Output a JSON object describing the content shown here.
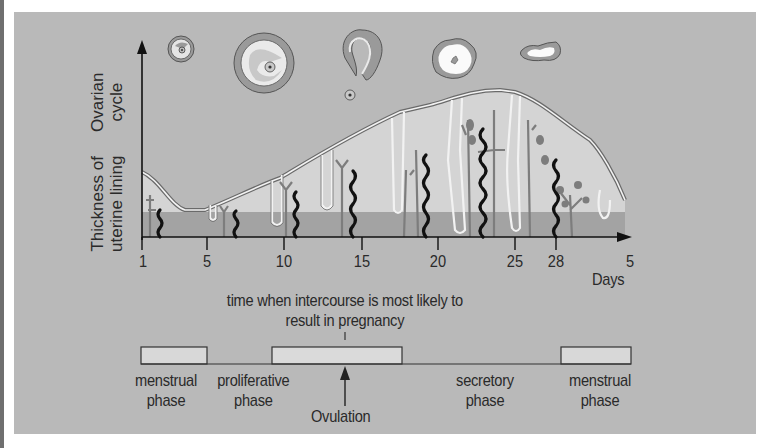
{
  "diagram": {
    "y_axis_labels": {
      "upper": [
        "Ovarian",
        "cycle"
      ],
      "lower": [
        "Thickness of",
        "uterine lining"
      ]
    },
    "x_axis": {
      "ticks": [
        "1",
        "5",
        "10",
        "15",
        "20",
        "25",
        "28",
        "5"
      ],
      "unit_label": "Days"
    },
    "fertile_window_note": [
      "time when intercourse is most likely to",
      "result in pregnancy"
    ],
    "phases": [
      {
        "label": [
          "menstrual",
          "phase"
        ]
      },
      {
        "label": [
          "proliferative",
          "phase"
        ]
      },
      {
        "label": [
          "secretory",
          "phase"
        ]
      },
      {
        "label": [
          "menstrual",
          "phase"
        ]
      }
    ],
    "ovulation_label": "Ovulation",
    "ovarian_stages": [
      "primary-follicle-icon",
      "mature-follicle-icon",
      "ruptured-follicle-icon",
      "corpus-luteum-icon",
      "corpus-albicans-icon"
    ],
    "colors": {
      "panel_bg": "#b9b9b9",
      "lining_light": "#d4d4d4",
      "lining_base": "#a3a3a3",
      "artery": "#111111",
      "gland": "#7d7d7d"
    }
  }
}
